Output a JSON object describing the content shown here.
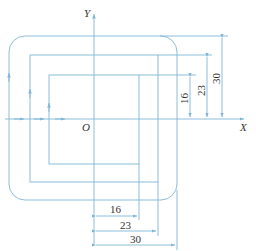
{
  "diagram": {
    "axes": {
      "x_label": "X",
      "y_label": "Y",
      "origin_label": "O"
    },
    "colors": {
      "line": "#7fb6d6",
      "text": "#333333"
    },
    "rectangles": [
      {
        "name": "outer",
        "half_size": 30
      },
      {
        "name": "middle",
        "half_size": 23
      },
      {
        "name": "inner",
        "half_size": 16
      }
    ],
    "dimensions": {
      "vertical": [
        "16",
        "23",
        "30"
      ],
      "horizontal": [
        "16",
        "23",
        "30"
      ]
    }
  }
}
